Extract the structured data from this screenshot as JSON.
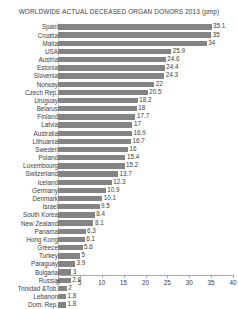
{
  "chart_data": {
    "type": "bar",
    "orientation": "horizontal",
    "title": "WORLDWIDE ACTUAL DECEASED ORGAN DONORS 2013 (pmp)",
    "xlabel": "",
    "ylabel": "",
    "xlim": [
      0,
      40
    ],
    "xticks": [
      0,
      5,
      10,
      15,
      20,
      25,
      30,
      35,
      40
    ],
    "grid": false,
    "legend": "none",
    "bar_color": "#848484",
    "axis_color": "#a8a8a8",
    "text_color": "#3c3c3c",
    "categories": [
      "Spain",
      "Croatia",
      "Malta",
      "USA",
      "Austria",
      "Estonia",
      "Slovenia",
      "Norway",
      "Czech Rep.",
      "Uruguay",
      "Belarus",
      "Finland",
      "Latvia",
      "Australia",
      "Lithuania",
      "Sweden",
      "Poland",
      "Luxembourg",
      "Switzerland",
      "Iceland",
      "Germany",
      "Denmark",
      "Israel",
      "South Korea",
      "New Zealand",
      "Panama",
      "Hong Kong",
      "Greece",
      "Turkey",
      "Paraguay",
      "Bulgaria",
      "Russia",
      "Trinidad &Tob.",
      "Lebanon",
      "Dom. Rep."
    ],
    "values": [
      35.1,
      35,
      34,
      25.9,
      24.6,
      24.4,
      24.3,
      22,
      20.5,
      18.2,
      18,
      17.7,
      17,
      16.9,
      16.7,
      16,
      15.4,
      15.2,
      13.7,
      12.3,
      10.9,
      10.1,
      9.5,
      8.4,
      8.1,
      6.3,
      6.1,
      5.6,
      5,
      3.9,
      3,
      2.9,
      2,
      1.8,
      1.8
    ],
    "value_labels": [
      "35.1",
      "35",
      "34",
      "25.9",
      "24.6",
      "24.4",
      "24.3",
      "22",
      "20.5",
      "18.2",
      "18",
      "17.7",
      "17",
      "16.9",
      "16.7",
      "16",
      "15.4",
      "15.2",
      "13.7",
      "12.3",
      "10.9",
      "10.1",
      "9.5",
      "8.4",
      "8.1",
      "6.3",
      "6.1",
      "5.6",
      "5",
      "3.9",
      "3",
      "2.9",
      "2",
      "1.8",
      "1.8"
    ],
    "tick_labels": [
      "0",
      "5",
      "10",
      "15",
      "20",
      "25",
      "30",
      "35",
      "40"
    ]
  }
}
